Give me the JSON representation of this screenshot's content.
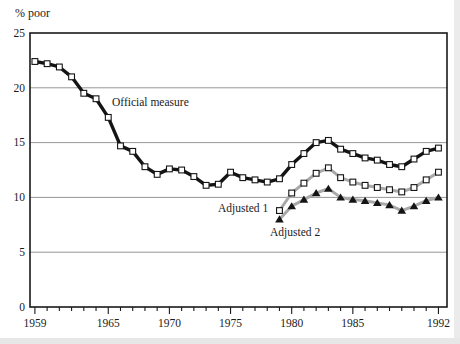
{
  "chart_data": {
    "type": "line",
    "title": "",
    "xlabel": "",
    "ylabel": "% poor",
    "xlim": [
      1958.6,
      1992.7
    ],
    "ylim": [
      0,
      25
    ],
    "grid": "horizontal",
    "legend_position": "inline-annotations",
    "colors": {
      "frame": "#1a1a1a",
      "grid": "#8a8a8a",
      "marker_edge": "#141414",
      "official_line": "#141414",
      "adjusted_line": "#a9a9a9",
      "background": "#ffffff"
    },
    "yticks": [
      {
        "value": 0,
        "label": "0"
      },
      {
        "value": 5,
        "label": "5"
      },
      {
        "value": 10,
        "label": "10"
      },
      {
        "value": 15,
        "label": "15"
      },
      {
        "value": 20,
        "label": "20"
      },
      {
        "value": 25,
        "label": "25"
      }
    ],
    "xticks": [
      {
        "year": 1959,
        "label": "1959"
      },
      {
        "year": 1965,
        "label": "1965"
      },
      {
        "year": 1970,
        "label": "1970"
      },
      {
        "year": 1975,
        "label": "1975"
      },
      {
        "year": 1980,
        "label": "1980"
      },
      {
        "year": 1985,
        "label": "1985"
      },
      {
        "year": 1992,
        "label": "1992"
      }
    ],
    "x_minor_from": 1959,
    "x_minor_to": 1992,
    "series": [
      {
        "name": "Adjusted 2",
        "color": "#a9a9a9",
        "width": 3,
        "marker": "triangle-filled",
        "x": [
          1979,
          1980,
          1981,
          1982,
          1983,
          1984,
          1985,
          1986,
          1987,
          1988,
          1989,
          1990,
          1991,
          1992
        ],
        "values": [
          8.0,
          9.2,
          9.8,
          10.4,
          10.8,
          10.0,
          9.8,
          9.7,
          9.5,
          9.3,
          8.8,
          9.2,
          9.7,
          10.0
        ]
      },
      {
        "name": "Adjusted 1",
        "color": "#a9a9a9",
        "width": 3,
        "marker": "square-open",
        "x": [
          1979,
          1980,
          1981,
          1982,
          1983,
          1984,
          1985,
          1986,
          1987,
          1988,
          1989,
          1990,
          1991,
          1992
        ],
        "values": [
          8.8,
          10.4,
          11.3,
          12.2,
          12.7,
          11.8,
          11.4,
          11.1,
          10.9,
          10.7,
          10.5,
          10.9,
          11.6,
          12.3
        ]
      },
      {
        "name": "Official measure",
        "color": "#141414",
        "width": 3.4,
        "marker": "square-open",
        "x": [
          1959,
          1960,
          1961,
          1962,
          1963,
          1964,
          1965,
          1966,
          1967,
          1968,
          1969,
          1970,
          1971,
          1972,
          1973,
          1974,
          1975,
          1976,
          1977,
          1978,
          1979,
          1980,
          1981,
          1982,
          1983,
          1984,
          1985,
          1986,
          1987,
          1988,
          1989,
          1990,
          1991,
          1992
        ],
        "values": [
          22.4,
          22.2,
          21.9,
          21.0,
          19.5,
          19.0,
          17.3,
          14.7,
          14.2,
          12.8,
          12.1,
          12.6,
          12.5,
          11.9,
          11.1,
          11.2,
          12.3,
          11.8,
          11.6,
          11.4,
          11.7,
          13.0,
          14.0,
          15.0,
          15.2,
          14.4,
          14.0,
          13.6,
          13.4,
          13.0,
          12.8,
          13.5,
          14.2,
          14.5
        ]
      }
    ],
    "annotations": [
      {
        "text": "Official measure"
      },
      {
        "text": "Adjusted 1"
      },
      {
        "text": "Adjusted 2"
      }
    ]
  }
}
